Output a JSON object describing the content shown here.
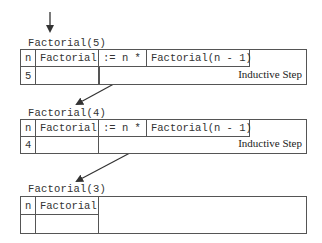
{
  "frames": [
    {
      "label": "Factorial(5)",
      "n_header": "n",
      "fact_header": "Factorial",
      "assign": ":= n *",
      "call": "Factorial(n - 1)",
      "n_value": "5",
      "step_label": "Inductive Step"
    },
    {
      "label": "Factorial(4)",
      "n_header": "n",
      "fact_header": "Factorial",
      "assign": ":= n *",
      "call": "Factorial(n - 1)",
      "n_value": "4",
      "step_label": "Inductive Step"
    },
    {
      "label": "Factorial(3)",
      "n_header": "n",
      "fact_header": "Factorial",
      "n_value": ""
    }
  ],
  "colors": {
    "line": "#555555",
    "arrow": "#333333",
    "text": "#333333"
  }
}
